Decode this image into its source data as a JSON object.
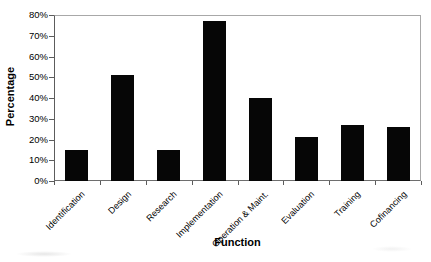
{
  "chart_data": {
    "type": "bar",
    "title": "",
    "xlabel": "Function",
    "ylabel": "Percentage",
    "categories": [
      "Identification",
      "Design",
      "Research",
      "Implementation",
      "Operation & Maint.",
      "Evaluation",
      "Training",
      "Cofinancing"
    ],
    "values": [
      15,
      51,
      15,
      77,
      40,
      21,
      27,
      26
    ],
    "value_unit": "%",
    "ylim": [
      0,
      80
    ],
    "ytick_step": 10,
    "ytick_labels": [
      "0%",
      "10%",
      "20%",
      "30%",
      "40%",
      "50%",
      "60%",
      "70%",
      "80%"
    ],
    "bar_color": "#060606",
    "grid": false,
    "legend": false,
    "layout_hints": {
      "bar_orientation": "vertical",
      "xlabel_rotation_deg": 45,
      "axis_frame": "full-box",
      "legend_position": "none"
    }
  }
}
